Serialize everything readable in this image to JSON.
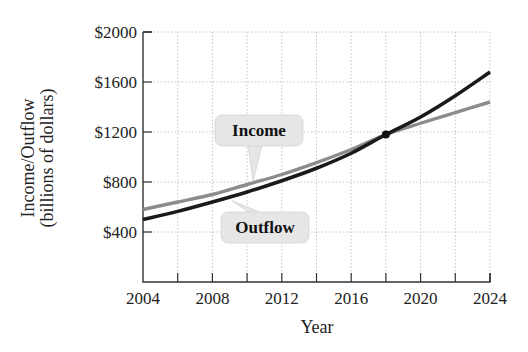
{
  "chart_data": {
    "type": "line",
    "title": "",
    "xlabel": "Year",
    "ylabel": "Income/Outflow (billions of dollars)",
    "ylabel_lines": [
      "Income/Outflow",
      "(billions of dollars)"
    ],
    "xlim": [
      2004,
      2024
    ],
    "ylim": [
      0,
      2000
    ],
    "x_ticks": [
      2004,
      2008,
      2012,
      2016,
      2020,
      2024
    ],
    "x_minor_ticks": [
      2006,
      2010,
      2014,
      2018,
      2022
    ],
    "x_tick_labels": [
      "2004",
      "2008",
      "2012",
      "2016",
      "2020",
      "2024"
    ],
    "y_ticks": [
      400,
      800,
      1200,
      1600,
      2000
    ],
    "y_tick_labels": [
      "$400",
      "$800",
      "$1200",
      "$1600",
      "$2000"
    ],
    "grid": true,
    "x": [
      2004,
      2006,
      2008,
      2010,
      2012,
      2014,
      2016,
      2018,
      2020,
      2022,
      2024
    ],
    "series": [
      {
        "name": "Income",
        "color": "#8c8c8c",
        "values": [
          580,
          640,
          700,
          780,
          860,
          955,
          1060,
          1180,
          1270,
          1355,
          1440
        ]
      },
      {
        "name": "Outflow",
        "color": "#1a1a1a",
        "values": [
          500,
          565,
          640,
          720,
          810,
          910,
          1030,
          1180,
          1320,
          1490,
          1680
        ]
      }
    ],
    "annotations": [
      {
        "type": "point",
        "label": "intersection",
        "x": 2018,
        "y": 1180
      },
      {
        "type": "callout",
        "text": "Income",
        "target_series": "Income"
      },
      {
        "type": "callout",
        "text": "Outflow",
        "target_series": "Outflow"
      }
    ],
    "legend": "callouts"
  },
  "labels": {
    "income_callout": "Income",
    "outflow_callout": "Outflow",
    "x_title": "Year",
    "y_title_line1": "Income/Outflow",
    "y_title_line2": "(billions of dollars)"
  },
  "colors": {
    "income": "#8c8c8c",
    "outflow": "#1a1a1a",
    "callout_bg": "#e6e6e6",
    "grid": "#b8b8b8",
    "axis": "#333333"
  }
}
